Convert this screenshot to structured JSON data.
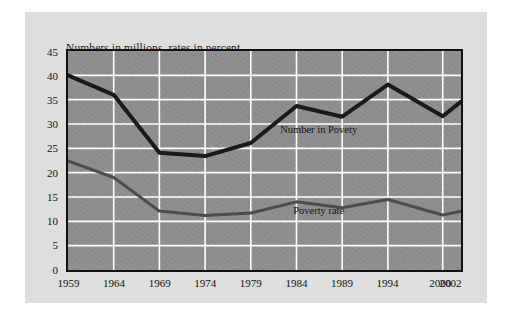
{
  "figure": {
    "title": "Numbers in millions, rates in percent",
    "background_color": "#dedede",
    "plot_background_color": "#8d8d8d",
    "gridline_color": "#ffffff",
    "border_color": "#111111"
  },
  "chart_data": {
    "type": "line",
    "title": "Numbers in millions, rates in percent",
    "xlabel": "",
    "ylabel": "",
    "categories": [
      "1959",
      "1964",
      "1969",
      "1974",
      "1979",
      "1984",
      "1989",
      "1994",
      "2000",
      "2002"
    ],
    "x": [
      1959,
      1964,
      1969,
      1974,
      1979,
      1984,
      1989,
      1994,
      2000,
      2002
    ],
    "xlim": [
      1959,
      2002
    ],
    "ylim": [
      0,
      45
    ],
    "yticks": [
      0,
      5,
      10,
      15,
      20,
      25,
      30,
      35,
      40,
      45
    ],
    "grid": true,
    "legend_position": "inline-annotations",
    "series": [
      {
        "name": "Number in Povety",
        "color": "#1a1a1a",
        "line_width": 4,
        "values": [
          40.0,
          36.0,
          24.1,
          23.4,
          26.1,
          33.7,
          31.5,
          38.1,
          31.6,
          34.6
        ]
      },
      {
        "name": "Poverty rate",
        "color": "#4c4c4c",
        "line_width": 3,
        "values": [
          22.4,
          19.0,
          12.1,
          11.2,
          11.7,
          14.0,
          12.8,
          14.5,
          11.3,
          12.1
        ]
      }
    ],
    "annotations": [
      {
        "text": "Number in Povety",
        "x": 1986.5,
        "y": 28.8
      },
      {
        "text": "Poverty rate",
        "x": 1986.5,
        "y": 12.2
      }
    ]
  },
  "axes": {
    "y_tick_labels": [
      "45",
      "40",
      "35",
      "30",
      "25",
      "20",
      "15",
      "10",
      "5",
      "0"
    ],
    "x_tick_labels": [
      "1959",
      "1964",
      "1969",
      "1974",
      "1979",
      "1984",
      "1989",
      "1994",
      "2000",
      "2002"
    ]
  }
}
